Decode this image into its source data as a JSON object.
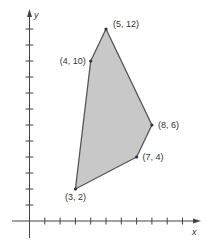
{
  "chart_data": {
    "type": "polygon",
    "title": "",
    "xlabel": "x",
    "ylabel": "y",
    "xlim": [
      0,
      11
    ],
    "ylim": [
      0,
      13
    ],
    "x_ticks": [
      1,
      2,
      3,
      4,
      5,
      6,
      7,
      8,
      9,
      10
    ],
    "y_ticks": [
      1,
      2,
      3,
      4,
      5,
      6,
      7,
      8,
      9,
      10,
      11,
      12
    ],
    "tick_labels_shown": false,
    "grid": false,
    "polygon": {
      "vertices": [
        {
          "x": 3,
          "y": 2,
          "label": "(3, 2)"
        },
        {
          "x": 4,
          "y": 10,
          "label": "(4, 10)"
        },
        {
          "x": 5,
          "y": 12,
          "label": "(5, 12)"
        },
        {
          "x": 8,
          "y": 6,
          "label": "(8, 6)"
        },
        {
          "x": 7,
          "y": 4,
          "label": "(7, 4)"
        }
      ],
      "fill_color": "#c8c8c8",
      "stroke_color": "#555555"
    }
  },
  "axes": {
    "x_label": "x",
    "y_label": "y",
    "color": "#444444"
  }
}
